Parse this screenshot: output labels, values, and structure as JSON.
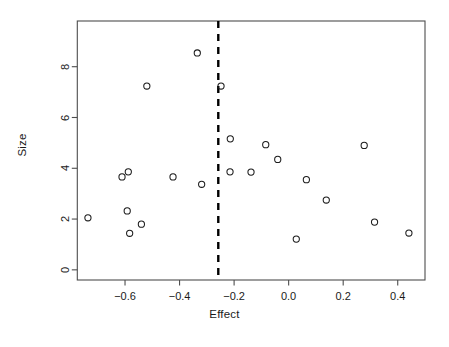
{
  "chart_data": {
    "type": "scatter",
    "title": "",
    "xlabel": "Effect",
    "ylabel": "Size",
    "xlim": [
      -0.775,
      0.5
    ],
    "ylim": [
      -0.4,
      9.8
    ],
    "xticks": [
      -0.6,
      -0.4,
      -0.2,
      0.0,
      0.2,
      0.4
    ],
    "xtick_labels": [
      "-0.6",
      "-0.4",
      "-0.2",
      "0.0",
      "0.2",
      "0.4"
    ],
    "yticks": [
      0,
      2,
      4,
      6,
      8
    ],
    "ytick_labels": [
      "0",
      "2",
      "4",
      "6",
      "8"
    ],
    "grid": false,
    "legend": null,
    "marker": "open-circle",
    "marker_color": "#1a1a1a",
    "marker_fill": "none",
    "marker_radius": 3.1,
    "points": [
      {
        "x": -0.736,
        "y": 2.05
      },
      {
        "x": -0.611,
        "y": 3.66
      },
      {
        "x": -0.588,
        "y": 3.86
      },
      {
        "x": -0.592,
        "y": 2.32
      },
      {
        "x": -0.583,
        "y": 1.44
      },
      {
        "x": -0.54,
        "y": 1.8
      },
      {
        "x": -0.52,
        "y": 7.24
      },
      {
        "x": -0.424,
        "y": 3.66
      },
      {
        "x": -0.335,
        "y": 8.54
      },
      {
        "x": -0.319,
        "y": 3.37
      },
      {
        "x": -0.248,
        "y": 7.24
      },
      {
        "x": -0.214,
        "y": 5.16
      },
      {
        "x": -0.215,
        "y": 3.86
      },
      {
        "x": -0.138,
        "y": 3.85
      },
      {
        "x": -0.084,
        "y": 4.93
      },
      {
        "x": -0.04,
        "y": 4.35
      },
      {
        "x": 0.028,
        "y": 1.21
      },
      {
        "x": 0.065,
        "y": 3.55
      },
      {
        "x": 0.138,
        "y": 2.75
      },
      {
        "x": 0.277,
        "y": 4.9
      },
      {
        "x": 0.315,
        "y": 1.88
      },
      {
        "x": 0.441,
        "y": 1.45
      }
    ],
    "reference_line": {
      "orientation": "vertical",
      "x": -0.258,
      "style": "dashed",
      "color": "#000000",
      "width": 2.4
    },
    "frame_color": "#4d4d4d",
    "background": "#ffffff"
  }
}
